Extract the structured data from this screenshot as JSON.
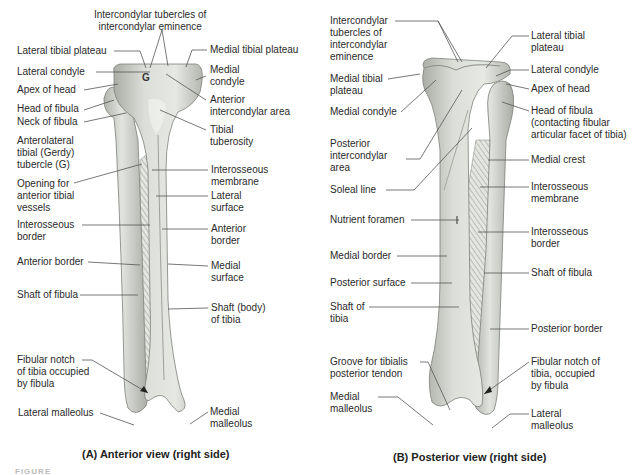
{
  "figure_label": "FIGURE",
  "panels": {
    "anterior": {
      "caption": "(A) Anterior view (right side)",
      "gerdy_mark": "G",
      "labels": {
        "intercondylar_tubercles": "Intercondylar tubercles of\nintercondylar eminence",
        "lateral_tibial_plateau": "Lateral tibial plateau",
        "medial_tibial_plateau": "Medial tibial plateau",
        "lateral_condyle": "Lateral condyle",
        "medial_condyle": "Medial\ncondyle",
        "apex_of_head": "Apex of head",
        "anterior_intercondylar_area": "Anterior\nintercondylar area",
        "head_of_fibula": "Head of fibula",
        "neck_of_fibula": "Neck of fibula",
        "tibial_tuberosity": "Tibial\ntuberosity",
        "gerdy_tubercle": "Anterolateral\ntibial (Gerdy)\ntubercle (G)",
        "opening_anterior_tibial": "Opening for\nanterior tibial\nvessels",
        "interosseous_membrane": "Interosseous\nmembrane",
        "lateral_surface": "Lateral\nsurface",
        "interosseous_border": "Interosseous\nborder",
        "anterior_border_tibia": "Anterior\nborder",
        "anterior_border_fibula": "Anterior border",
        "medial_surface": "Medial\nsurface",
        "shaft_of_fibula": "Shaft of fibula",
        "shaft_of_tibia": "Shaft (body)\nof tibia",
        "fibular_notch": "Fibular notch\nof tibia occupied\nby fibula",
        "lateral_malleolus": "Lateral malleolus",
        "medial_malleolus": "Medial\nmalleolus"
      }
    },
    "posterior": {
      "caption": "(B) Posterior view (right side)",
      "labels": {
        "intercondylar_tubercles": "Intercondylar\ntubercles of\nintercondylar\neminence",
        "lateral_tibial_plateau": "Lateral tibial\nplateau",
        "medial_tibial_plateau": "Medial tibial\nplateau",
        "lateral_condyle": "Lateral condyle",
        "apex_of_head": "Apex of head",
        "medial_condyle": "Medial condyle",
        "head_of_fibula": "Head of fibula\n(contacting fibular\narticular facet of tibia)",
        "posterior_intercondylar_area": "Posterior\nintercondylar\narea",
        "medial_crest": "Medial crest",
        "soleal_line": "Soleal line",
        "interosseous_membrane": "Interosseous\nmembrane",
        "nutrient_foramen": "Nutrient foramen",
        "interosseous_border": "Interosseous\nborder",
        "medial_border": "Medial border",
        "shaft_of_fibula": "Shaft of fibula",
        "posterior_surface": "Posterior surface",
        "shaft_of_tibia": "Shaft of\ntibia",
        "posterior_border": "Posterior border",
        "groove_tibialis_posterior": "Groove for tibialis\nposterior tendon",
        "fibular_notch": "Fibular notch of\ntibia, occupied\nby fibula",
        "medial_malleolus": "Medial\nmalleolus",
        "lateral_malleolus": "Lateral\nmalleolus"
      }
    }
  },
  "colors": {
    "bone_fill": "#d9dcd6",
    "bone_shadow": "#b7bbb4",
    "bone_highlight": "#eef0ec",
    "leader_line": "#555555"
  }
}
